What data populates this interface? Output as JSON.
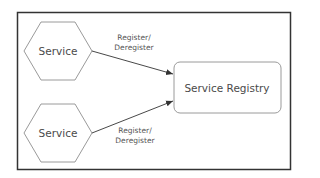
{
  "diagram": {
    "nodes": [
      {
        "id": "service-top",
        "label": "Service",
        "shape": "hexagon"
      },
      {
        "id": "service-bottom",
        "label": "Service",
        "shape": "hexagon"
      },
      {
        "id": "registry",
        "label": "Service Registry",
        "shape": "rounded-rectangle"
      }
    ],
    "edges": [
      {
        "from": "service-top",
        "to": "registry",
        "label_line1": "Register/",
        "label_line2": "Deregister"
      },
      {
        "from": "service-bottom",
        "to": "registry",
        "label_line1": "Register/",
        "label_line2": "Deregister"
      }
    ],
    "colors": {
      "frame": "#333333",
      "shape_stroke": "#9a9a9a",
      "edge": "#333333",
      "text": "#4a4a4a"
    }
  }
}
